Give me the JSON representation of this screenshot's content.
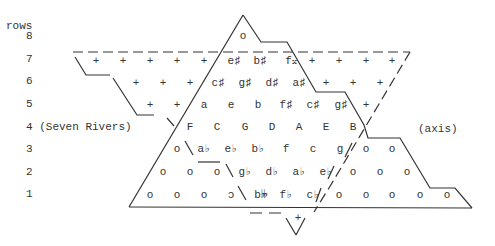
{
  "labels": {
    "rows_header": "rows",
    "row_numbers": [
      "8",
      "7",
      "6",
      "5",
      "4 (Seven Rivers)",
      "3",
      "2",
      "1"
    ],
    "axis": "(axis)"
  },
  "rows": {
    "r8": [
      {
        "text": "o",
        "x": 243,
        "y": 36
      }
    ],
    "r7": [
      {
        "text": "+",
        "x": 96,
        "y": 61
      },
      {
        "text": "+",
        "x": 123,
        "y": 61
      },
      {
        "text": "+",
        "x": 150,
        "y": 61
      },
      {
        "text": "+",
        "x": 177,
        "y": 61
      },
      {
        "text": "+",
        "x": 204,
        "y": 61
      },
      {
        "text": "e♯",
        "x": 234,
        "y": 61
      },
      {
        "text": "b♯",
        "x": 260,
        "y": 61
      },
      {
        "text": "f𝄪",
        "x": 291,
        "y": 61
      },
      {
        "text": "+",
        "x": 312,
        "y": 61
      },
      {
        "text": "+",
        "x": 339,
        "y": 61
      },
      {
        "text": "+",
        "x": 366,
        "y": 61
      },
      {
        "text": "+",
        "x": 392,
        "y": 61
      }
    ],
    "r6": [
      {
        "text": "+",
        "x": 136,
        "y": 83
      },
      {
        "text": "+",
        "x": 163,
        "y": 83
      },
      {
        "text": "+",
        "x": 190,
        "y": 83
      },
      {
        "text": "c♯",
        "x": 218,
        "y": 83
      },
      {
        "text": "g♯",
        "x": 245,
        "y": 83
      },
      {
        "text": "d♯",
        "x": 272,
        "y": 83
      },
      {
        "text": "a♯",
        "x": 299,
        "y": 83
      },
      {
        "text": "+",
        "x": 326,
        "y": 83
      },
      {
        "text": "+",
        "x": 353,
        "y": 83
      },
      {
        "text": "+",
        "x": 380,
        "y": 83
      }
    ],
    "r5": [
      {
        "text": "+",
        "x": 150,
        "y": 105
      },
      {
        "text": "+",
        "x": 177,
        "y": 105
      },
      {
        "text": "a",
        "x": 204,
        "y": 105
      },
      {
        "text": "e",
        "x": 231,
        "y": 105
      },
      {
        "text": "b",
        "x": 258,
        "y": 105
      },
      {
        "text": "f♯",
        "x": 286,
        "y": 105
      },
      {
        "text": "c♯",
        "x": 313,
        "y": 105
      },
      {
        "text": "g♯",
        "x": 341,
        "y": 105
      },
      {
        "text": "+",
        "x": 366,
        "y": 105
      }
    ],
    "r4": [
      {
        "text": "F",
        "x": 190,
        "y": 127
      },
      {
        "text": "C",
        "x": 217,
        "y": 127
      },
      {
        "text": "G",
        "x": 245,
        "y": 127
      },
      {
        "text": "D",
        "x": 272,
        "y": 127
      },
      {
        "text": "A",
        "x": 299,
        "y": 127
      },
      {
        "text": "E",
        "x": 326,
        "y": 127
      },
      {
        "text": "B",
        "x": 353,
        "y": 127
      }
    ],
    "r3": [
      {
        "text": "o",
        "x": 177,
        "y": 149
      },
      {
        "text": "a♭",
        "x": 204,
        "y": 149
      },
      {
        "text": "e♭",
        "x": 231,
        "y": 149
      },
      {
        "text": "b♭",
        "x": 258,
        "y": 149
      },
      {
        "text": "f",
        "x": 286,
        "y": 149
      },
      {
        "text": "c",
        "x": 313,
        "y": 149
      },
      {
        "text": "g",
        "x": 340,
        "y": 149
      },
      {
        "text": "o",
        "x": 366,
        "y": 149
      },
      {
        "text": "o",
        "x": 392,
        "y": 149
      }
    ],
    "r2": [
      {
        "text": "o",
        "x": 163,
        "y": 172
      },
      {
        "text": "o",
        "x": 190,
        "y": 172
      },
      {
        "text": "o",
        "x": 217,
        "y": 172
      },
      {
        "text": "g♭",
        "x": 245,
        "y": 172
      },
      {
        "text": "d♭",
        "x": 272,
        "y": 172
      },
      {
        "text": "a♭",
        "x": 299,
        "y": 172
      },
      {
        "text": "e♭",
        "x": 326,
        "y": 172
      },
      {
        "text": "o",
        "x": 353,
        "y": 172
      },
      {
        "text": "o",
        "x": 380,
        "y": 172
      },
      {
        "text": "o",
        "x": 407,
        "y": 172
      }
    ],
    "r1": [
      {
        "text": "o",
        "x": 150,
        "y": 195
      },
      {
        "text": "o",
        "x": 177,
        "y": 195
      },
      {
        "text": "o",
        "x": 204,
        "y": 195
      },
      {
        "text": "ɔ",
        "x": 231,
        "y": 195
      },
      {
        "text": "b𝄫",
        "x": 261,
        "y": 195
      },
      {
        "text": "f♭",
        "x": 286,
        "y": 195
      },
      {
        "text": "c♭",
        "x": 313,
        "y": 195
      },
      {
        "text": "o",
        "x": 339,
        "y": 195
      },
      {
        "text": "o",
        "x": 366,
        "y": 195
      },
      {
        "text": "o",
        "x": 392,
        "y": 195
      },
      {
        "text": "o",
        "x": 420,
        "y": 195
      },
      {
        "text": "o",
        "x": 447,
        "y": 195
      }
    ],
    "below": [
      {
        "text": "+",
        "x": 298,
        "y": 218
      }
    ]
  }
}
